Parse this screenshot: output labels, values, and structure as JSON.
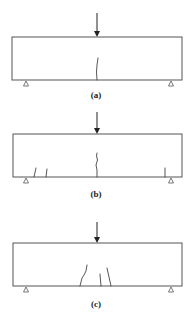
{
  "figure": {
    "panels": [
      {
        "id": "a",
        "label": "(a)",
        "description": "Single flexural crack at midspan under central point load"
      },
      {
        "id": "b",
        "label": "(b)",
        "description": "Midspan flexural crack plus cracks near supports"
      },
      {
        "id": "c",
        "label": "(c)",
        "description": "Multiple inclined cracks near midspan"
      }
    ],
    "colors": {
      "line": "#555555",
      "crack": "#444444",
      "arrow": "#222222",
      "background": "#ffffff"
    }
  }
}
